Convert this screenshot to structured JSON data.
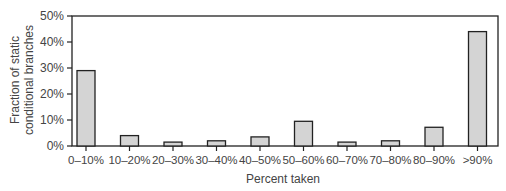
{
  "chart_data": {
    "type": "bar",
    "title": "",
    "xlabel": "Percent taken",
    "ylabel": "Fraction of static conditional branches",
    "ylabel_lines": [
      "Fraction of static",
      "conditional branches"
    ],
    "categories": [
      "0–10%",
      "10–20%",
      "20–30%",
      "30–40%",
      "40–50%",
      "50–60%",
      "60–70%",
      "70–80%",
      "80–90%",
      ">90%"
    ],
    "values": [
      29,
      4,
      1.5,
      2,
      3.5,
      9.5,
      1.5,
      2,
      7.2,
      44
    ],
    "value_unit": "%",
    "ylim": [
      0,
      50
    ],
    "yticks": [
      0,
      10,
      20,
      30,
      40,
      50
    ],
    "ytick_labels": [
      "0%",
      "10%",
      "20%",
      "30%",
      "40%",
      "50%"
    ],
    "grid": false,
    "legend": null,
    "bar_color": "#d4d4d4",
    "bar_edge_color": "#222222"
  }
}
